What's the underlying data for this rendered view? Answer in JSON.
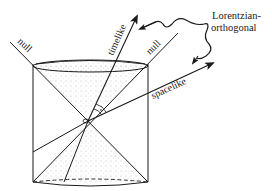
{
  "figure": {
    "labels": {
      "null_left": "null",
      "null_right": "null",
      "timelike": "timelike",
      "spacelike": "spacelike",
      "annotation_line1": "Lorentzian-",
      "annotation_line2": "orthogonal"
    },
    "colors": {
      "ink": "#1a1a1a",
      "background": "#ffffff",
      "stipple": "#8a8a8a"
    }
  }
}
